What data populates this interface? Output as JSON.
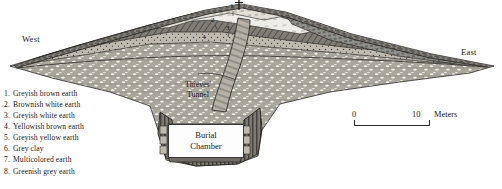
{
  "figure": {
    "orientation": {
      "west_label": "West",
      "east_label": "East"
    },
    "features": {
      "tunnel_label_line1": "Thieves'",
      "tunnel_label_line2": "Tunnel",
      "chamber_label_line1": "Burial",
      "chamber_label_line2": "Chamber",
      "summit_marker": "survey-post"
    },
    "scale_bar": {
      "min_label": "0",
      "max_label": "10",
      "unit_label": "Meters"
    },
    "legend": {
      "items": [
        {
          "number": "1.",
          "label": "Greyish brown earth",
          "fill": "#6d6d6d"
        },
        {
          "number": "2.",
          "label": "Brownish white earth",
          "fill": "#d8d4cc"
        },
        {
          "number": "3.",
          "label": "Greyish white earth",
          "fill": "#e8e6e0"
        },
        {
          "number": "4.",
          "label": "Yellowish brown earth",
          "fill": "#8d8madd"
        },
        {
          "number": "5.",
          "label": "Greyish yellow earth",
          "fill": "#b9b5a8"
        },
        {
          "number": "6.",
          "label": "Grey clay",
          "fill": "#8a8a8a"
        },
        {
          "number": "7.",
          "label": "Multicolored earth",
          "fill": "#9a9a96"
        },
        {
          "number": "8.",
          "label": "Greenish grey earth",
          "fill": "#7e8480"
        }
      ]
    },
    "strata_callouts": [
      {
        "id": "1",
        "x": 233,
        "y": 6
      },
      {
        "id": "2",
        "x": 214,
        "y": 20
      },
      {
        "id": "3",
        "x": 229,
        "y": 28
      },
      {
        "id": "4",
        "x": 205,
        "y": 36
      }
    ],
    "colors": {
      "ink": "#1a1a1a",
      "line": "#2b2b2b",
      "paper": "#ffffff",
      "mound_upper": "#6f6f6f",
      "mound_mid": "#cfcbc2",
      "mound_body": "#b4b0a6",
      "chamber_fill": "#fdfdfd"
    }
  }
}
